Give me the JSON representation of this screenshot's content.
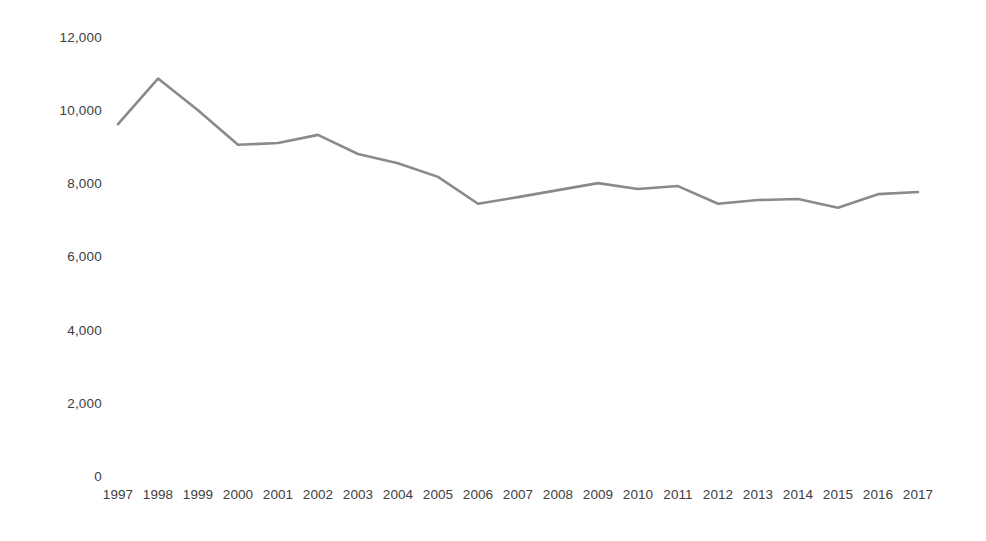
{
  "chart_data": {
    "type": "line",
    "title": "",
    "subtitle": "",
    "xlabel": "",
    "ylabel": "",
    "grid": false,
    "legend": false,
    "legend_position": "none",
    "line_color": "#8a8a8a",
    "text_color": "#404040",
    "background_color": "#ffffff",
    "categories": [
      "1997",
      "1998",
      "1999",
      "2000",
      "2001",
      "2002",
      "2003",
      "2004",
      "2005",
      "2006",
      "2007",
      "2008",
      "2009",
      "2010",
      "2011",
      "2012",
      "2013",
      "2014",
      "2015",
      "2016",
      "2017"
    ],
    "values": [
      9660,
      10900,
      10040,
      9100,
      9150,
      9370,
      8850,
      8600,
      8230,
      7500,
      7680,
      7870,
      8060,
      7900,
      7980,
      7500,
      7600,
      7630,
      7390,
      7760,
      7820
    ],
    "series": [
      {
        "name": "series-1",
        "values": [
          9660,
          10900,
          10040,
          9100,
          9150,
          9370,
          8850,
          8600,
          8230,
          7500,
          7680,
          7870,
          8060,
          7900,
          7980,
          7500,
          7600,
          7630,
          7390,
          7760,
          7820
        ]
      }
    ],
    "ylim": [
      0,
      12000
    ],
    "y_ticks": [
      0,
      2000,
      4000,
      6000,
      8000,
      10000,
      12000
    ],
    "y_tick_labels": [
      "0",
      "2,000",
      "4,000",
      "6,000",
      "8,000",
      "10,000",
      "12,000"
    ],
    "x_tick_labels": [
      "1997",
      "1998",
      "1999",
      "2000",
      "2001",
      "2002",
      "2003",
      "2004",
      "2005",
      "2006",
      "2007",
      "2008",
      "2009",
      "2010",
      "2011",
      "2012",
      "2013",
      "2014",
      "2015",
      "2016",
      "2017"
    ],
    "annotations": []
  }
}
